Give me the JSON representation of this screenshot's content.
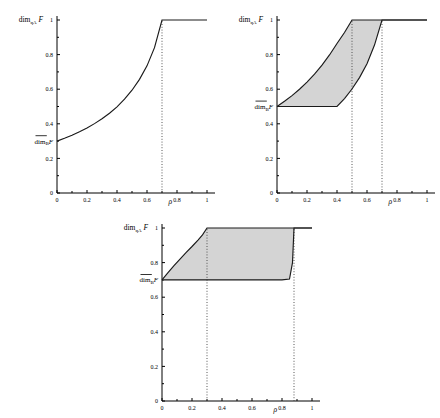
{
  "figure": {
    "background": "#ffffff",
    "stroke_color": "#1a1a1a",
    "fill_color": "#d4d4d4",
    "dotted_color": "#444444"
  },
  "axis": {
    "x_label": "ρ",
    "y_label_main": "dim",
    "y_label_sub": "qA",
    "y_label_italic": "F",
    "lower_label_main": "dim",
    "lower_label_sub": "B",
    "lower_label_italic": "F",
    "x_ticks": [
      "0",
      "0.2",
      "0.4",
      "0.6",
      "0.8",
      "1"
    ],
    "x_tick_values": [
      0,
      0.2,
      0.4,
      0.6,
      0.8,
      1
    ],
    "y_ticks": [
      "0",
      "0.2",
      "0.4",
      "0.6",
      "0.8",
      "1"
    ],
    "y_tick_values": [
      0,
      0.2,
      0.4,
      0.6,
      0.8,
      1
    ],
    "xlim": [
      0,
      1
    ],
    "ylim": [
      0,
      1
    ]
  },
  "chart_data": [
    {
      "id": "panel-1",
      "type": "line",
      "title": "",
      "xlabel": "ρ",
      "ylabel": "dim_qA F",
      "xlim": [
        0,
        1
      ],
      "ylim": [
        0,
        1
      ],
      "grid": false,
      "legend": "none",
      "annotations": [
        {
          "name": "lower-dim-label",
          "text": "dim_B F (overline)",
          "y": 0.3
        }
      ],
      "vlines": [
        0.7
      ],
      "series": [
        {
          "name": "dim_qA F",
          "x": [
            0.0,
            0.05,
            0.1,
            0.15,
            0.2,
            0.25,
            0.3,
            0.35,
            0.4,
            0.45,
            0.5,
            0.55,
            0.6,
            0.65,
            0.7,
            0.8,
            0.9,
            1.0
          ],
          "values": [
            0.3,
            0.316,
            0.334,
            0.354,
            0.376,
            0.401,
            0.429,
            0.461,
            0.498,
            0.542,
            0.594,
            0.657,
            0.735,
            0.84,
            1.0,
            1.0,
            1.0,
            1.0
          ]
        }
      ]
    },
    {
      "id": "panel-2",
      "type": "area",
      "title": "",
      "xlabel": "ρ",
      "ylabel": "dim_qA F",
      "xlim": [
        0,
        1
      ],
      "ylim": [
        0,
        1
      ],
      "grid": false,
      "legend": "none",
      "shaded_region": true,
      "annotations": [
        {
          "name": "lower-dim-label",
          "text": "dim_B F (overline)",
          "y": 0.5
        }
      ],
      "vlines": [
        0.5,
        0.7
      ],
      "series": [
        {
          "name": "upper-boundary",
          "x": [
            0.0,
            0.05,
            0.1,
            0.15,
            0.2,
            0.25,
            0.3,
            0.35,
            0.4,
            0.45,
            0.5,
            0.7,
            1.0
          ],
          "values": [
            0.5,
            0.53,
            0.563,
            0.6,
            0.641,
            0.687,
            0.739,
            0.798,
            0.864,
            0.928,
            1.0,
            1.0,
            1.0
          ]
        },
        {
          "name": "lower-boundary",
          "x": [
            0.0,
            0.1,
            0.2,
            0.3,
            0.4,
            0.45,
            0.5,
            0.55,
            0.6,
            0.65,
            0.7,
            0.8,
            1.0
          ],
          "values": [
            0.5,
            0.5,
            0.5,
            0.5,
            0.5,
            0.546,
            0.601,
            0.667,
            0.747,
            0.855,
            1.0,
            1.0,
            1.0
          ]
        }
      ]
    },
    {
      "id": "panel-3",
      "type": "area",
      "title": "",
      "xlabel": "ρ",
      "ylabel": "dim_qA F",
      "xlim": [
        0,
        1
      ],
      "ylim": [
        0,
        1
      ],
      "grid": false,
      "legend": "none",
      "shaded_region": true,
      "annotations": [
        {
          "name": "lower-dim-label",
          "text": "dim_B F (overline)",
          "y": 0.7
        }
      ],
      "vlines": [
        0.3,
        0.88
      ],
      "series": [
        {
          "name": "upper-boundary",
          "x": [
            0.0,
            0.04,
            0.08,
            0.12,
            0.16,
            0.2,
            0.24,
            0.27,
            0.3,
            0.5,
            0.7,
            0.88,
            1.0
          ],
          "values": [
            0.7,
            0.742,
            0.782,
            0.82,
            0.858,
            0.893,
            0.93,
            0.96,
            1.0,
            1.0,
            1.0,
            1.0,
            1.0
          ]
        },
        {
          "name": "lower-boundary",
          "x": [
            0.0,
            0.2,
            0.4,
            0.6,
            0.8,
            0.85,
            0.87,
            0.88,
            0.92,
            1.0
          ],
          "values": [
            0.7,
            0.7,
            0.7,
            0.7,
            0.7,
            0.705,
            0.8,
            1.0,
            1.0,
            1.0
          ]
        }
      ]
    }
  ]
}
